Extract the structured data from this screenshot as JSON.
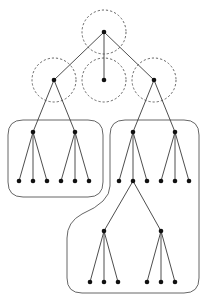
{
  "diagram": {
    "type": "tree-partition",
    "colors": {
      "node": "#111111",
      "edge": "#3a3a3a",
      "halo": "#555555",
      "group_outline": "#555555",
      "background": "#ffffff"
    },
    "halos": [
      {
        "id": "halo-root",
        "cx": 104,
        "cy": 32,
        "r": 22
      },
      {
        "id": "halo-left",
        "cx": 54,
        "cy": 80,
        "r": 22
      },
      {
        "id": "halo-middle",
        "cx": 104,
        "cy": 80,
        "r": 22
      },
      {
        "id": "halo-right",
        "cx": 154,
        "cy": 80,
        "r": 22
      }
    ],
    "nodes": [
      {
        "id": "root",
        "x": 104,
        "y": 32
      },
      {
        "id": "L",
        "x": 54,
        "y": 80
      },
      {
        "id": "M",
        "x": 104,
        "y": 80
      },
      {
        "id": "R",
        "x": 154,
        "y": 80
      },
      {
        "id": "L1",
        "x": 33,
        "y": 132
      },
      {
        "id": "L2",
        "x": 75,
        "y": 132
      },
      {
        "id": "R1",
        "x": 133,
        "y": 132
      },
      {
        "id": "R2",
        "x": 175,
        "y": 132
      },
      {
        "id": "L1a",
        "x": 19,
        "y": 181
      },
      {
        "id": "L1b",
        "x": 33,
        "y": 181
      },
      {
        "id": "L1c",
        "x": 47,
        "y": 181
      },
      {
        "id": "L2a",
        "x": 61,
        "y": 181
      },
      {
        "id": "L2b",
        "x": 75,
        "y": 181
      },
      {
        "id": "L2c",
        "x": 89,
        "y": 181
      },
      {
        "id": "R1a",
        "x": 119,
        "y": 181
      },
      {
        "id": "R1b",
        "x": 133,
        "y": 181
      },
      {
        "id": "R1c",
        "x": 147,
        "y": 181
      },
      {
        "id": "R2a",
        "x": 161,
        "y": 181
      },
      {
        "id": "R2b",
        "x": 175,
        "y": 181
      },
      {
        "id": "R2c",
        "x": 189,
        "y": 181
      },
      {
        "id": "S1",
        "x": 104,
        "y": 231
      },
      {
        "id": "S2",
        "x": 161,
        "y": 231
      },
      {
        "id": "S1a",
        "x": 90,
        "y": 282
      },
      {
        "id": "S1b",
        "x": 104,
        "y": 282
      },
      {
        "id": "S1c",
        "x": 118,
        "y": 282
      },
      {
        "id": "S2a",
        "x": 147,
        "y": 282
      },
      {
        "id": "S2b",
        "x": 161,
        "y": 282
      },
      {
        "id": "S2c",
        "x": 175,
        "y": 282
      }
    ],
    "edges": [
      [
        "root",
        "L"
      ],
      [
        "root",
        "M"
      ],
      [
        "root",
        "R"
      ],
      [
        "L",
        "L1"
      ],
      [
        "L",
        "L2"
      ],
      [
        "R",
        "R1"
      ],
      [
        "R",
        "R2"
      ],
      [
        "L1",
        "L1a"
      ],
      [
        "L1",
        "L1b"
      ],
      [
        "L1",
        "L1c"
      ],
      [
        "L2",
        "L2a"
      ],
      [
        "L2",
        "L2b"
      ],
      [
        "L2",
        "L2c"
      ],
      [
        "R1",
        "R1a"
      ],
      [
        "R1",
        "R1b"
      ],
      [
        "R1",
        "R1c"
      ],
      [
        "R2",
        "R2a"
      ],
      [
        "R2",
        "R2b"
      ],
      [
        "R2",
        "R2c"
      ],
      [
        "R1b",
        "S1"
      ],
      [
        "R1b",
        "S2"
      ],
      [
        "S1",
        "S1a"
      ],
      [
        "S1",
        "S1b"
      ],
      [
        "S1",
        "S1c"
      ],
      [
        "S2",
        "S2a"
      ],
      [
        "S2",
        "S2b"
      ],
      [
        "S2",
        "S2c"
      ]
    ],
    "groups": [
      {
        "id": "group-left",
        "path": "M 23 120 L 88 120 Q 103 120 103 135 L 103 182 Q 103 197 88 197 L 23 197 Q 8 197 8 182 L 8 135 Q 8 120 23 120 Z"
      },
      {
        "id": "group-right",
        "path": "M 125 120 L 184 120 Q 199 120 199 135 L 199 278 Q 199 293 184 293 L 82 293 Q 67 293 67 278 L 67 238 Q 67 222 82 214 Q 110 202 110 186 L 110 135 Q 110 120 125 120 Z"
      }
    ]
  }
}
